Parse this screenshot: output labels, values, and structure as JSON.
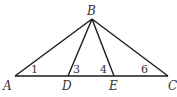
{
  "diagram": {
    "type": "geometry-triangle",
    "points": {
      "A": {
        "label": "A",
        "x": 15,
        "y": 76
      },
      "B": {
        "label": "B",
        "x": 92,
        "y": 19
      },
      "C": {
        "label": "C",
        "x": 168,
        "y": 76
      },
      "D": {
        "label": "D",
        "x": 68,
        "y": 76
      },
      "E": {
        "label": "E",
        "x": 114,
        "y": 76
      }
    },
    "segments": [
      "AB",
      "BC",
      "AC",
      "BD",
      "BE"
    ],
    "angle_labels": {
      "angle1": "1",
      "angle3": "3",
      "angle4": "4",
      "angle6": "6"
    }
  }
}
